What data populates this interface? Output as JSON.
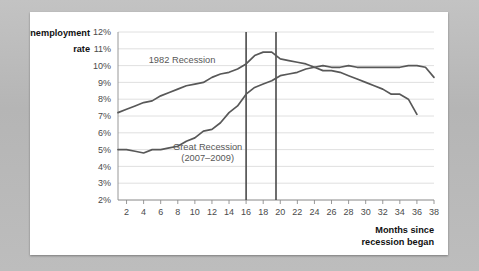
{
  "figure": {
    "background_color": "#b9b9b9",
    "card_color": "#ffffff",
    "line_color": "#585858",
    "marker_line_color": "#4a4a4a",
    "grid_color": "#d8d8d8"
  },
  "chart_data": {
    "type": "line",
    "title": "",
    "ylabel_line1": "Unemployment",
    "ylabel_line2": "rate",
    "xlabel_line1": "Months since",
    "xlabel_line2": "recession began",
    "xlabel": "Months since recession began",
    "ylabel": "Unemployment rate",
    "grid": true,
    "legend": "inline-annotations",
    "xlim": [
      1,
      38
    ],
    "ylim": [
      2,
      12
    ],
    "ytick_labels": [
      "12%",
      "11%",
      "10%",
      "9%",
      "8%",
      "7%",
      "6%",
      "5%",
      "4%",
      "3%",
      "2%"
    ],
    "ytick_values": [
      12,
      11,
      10,
      9,
      8,
      7,
      6,
      5,
      4,
      3,
      2
    ],
    "xtick_labels": [
      "2",
      "4",
      "6",
      "8",
      "10",
      "12",
      "14",
      "16",
      "18",
      "20",
      "22",
      "24",
      "26",
      "28",
      "30",
      "32",
      "34",
      "36",
      "38"
    ],
    "xtick_values": [
      2,
      4,
      6,
      8,
      10,
      12,
      14,
      16,
      18,
      20,
      22,
      24,
      26,
      28,
      30,
      32,
      34,
      36,
      38
    ],
    "annotations": [
      {
        "text": "1982 Recession",
        "x": 8.5,
        "y": 10.15
      },
      {
        "text": "Great Recession",
        "x": 11.5,
        "y": 5.0
      },
      {
        "text": "(2007–2009)",
        "x": 11.5,
        "y": 4.35
      }
    ],
    "vertical_markers": [
      {
        "x": 16,
        "label": "16",
        "y_top": 12,
        "y_bottom": 2
      },
      {
        "x": 19.5,
        "label": "19.5",
        "y_top": 12,
        "y_bottom": 2
      }
    ],
    "series": [
      {
        "name": "1982 Recession",
        "x": [
          1,
          2,
          3,
          4,
          5,
          6,
          7,
          8,
          9,
          10,
          11,
          12,
          13,
          14,
          15,
          16,
          17,
          18,
          19,
          20,
          21,
          22,
          23,
          24,
          25,
          26,
          27,
          28,
          29,
          30,
          31,
          32,
          33,
          34,
          35,
          36,
          37,
          38
        ],
        "values": [
          7.2,
          7.4,
          7.6,
          7.8,
          7.9,
          8.2,
          8.4,
          8.6,
          8.8,
          8.9,
          9.0,
          9.3,
          9.5,
          9.6,
          9.8,
          10.1,
          10.6,
          10.8,
          10.8,
          10.4,
          10.3,
          10.2,
          10.1,
          9.9,
          10.0,
          9.9,
          9.9,
          10.0,
          9.9,
          9.9,
          9.9,
          9.9,
          9.9,
          9.9,
          10.0,
          10.0,
          9.9,
          9.3
        ]
      },
      {
        "name": "Great Recession (2007–2009)",
        "x": [
          1,
          2,
          3,
          4,
          5,
          6,
          7,
          8,
          9,
          10,
          11,
          12,
          13,
          14,
          15,
          16,
          17,
          18,
          19,
          20,
          21,
          22,
          23,
          24,
          25,
          26,
          27,
          28,
          29,
          30,
          31,
          32,
          33,
          34,
          35,
          36
        ],
        "values": [
          5.0,
          5.0,
          4.9,
          4.8,
          5.0,
          5.0,
          5.1,
          5.2,
          5.5,
          5.7,
          6.1,
          6.2,
          6.6,
          7.2,
          7.6,
          8.3,
          8.7,
          8.9,
          9.1,
          9.4,
          9.5,
          9.6,
          9.8,
          9.9,
          9.7,
          9.7,
          9.6,
          9.4,
          9.2,
          9.0,
          8.8,
          8.6,
          8.3,
          8.3,
          8.0,
          7.1
        ]
      }
    ]
  }
}
